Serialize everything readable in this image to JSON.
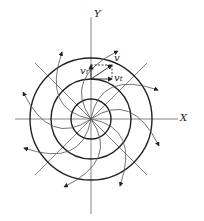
{
  "diagram": {
    "type": "spiral velocity field around concentric circles",
    "axes": {
      "x_label": "X",
      "y_label": "Y"
    },
    "circles": [
      {
        "radius": 20
      },
      {
        "radius": 40
      },
      {
        "radius": 61
      }
    ],
    "velocity_labels": {
      "v": "v",
      "v_r": "v",
      "v_r_sub": "r",
      "v_t": "v",
      "v_t_sub": "t"
    },
    "colors": {
      "line": "#222222",
      "thin": "#555555",
      "background": "#ffffff"
    }
  }
}
